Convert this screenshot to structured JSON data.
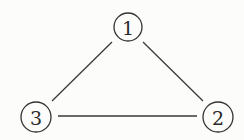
{
  "diagram": {
    "type": "undirected-graph",
    "nodes": [
      {
        "id": "1",
        "label": "1",
        "cx": 128,
        "cy": 27,
        "r": 14
      },
      {
        "id": "2",
        "label": "2",
        "cx": 218,
        "cy": 117,
        "r": 15
      },
      {
        "id": "3",
        "label": "3",
        "cx": 36,
        "cy": 117,
        "r": 15
      }
    ],
    "edges": [
      {
        "from": "1",
        "to": "3",
        "x1": 112,
        "y1": 42,
        "x2": 52,
        "y2": 101
      },
      {
        "from": "1",
        "to": "2",
        "x1": 143,
        "y1": 42,
        "x2": 203,
        "y2": 101
      },
      {
        "from": "3",
        "to": "2",
        "x1": 58,
        "y1": 116,
        "x2": 197,
        "y2": 116
      }
    ]
  }
}
